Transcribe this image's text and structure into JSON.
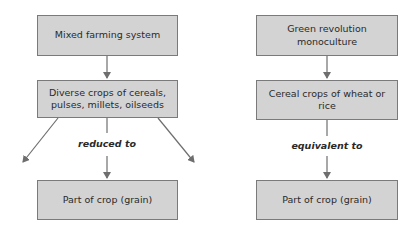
{
  "diagram": {
    "left": {
      "title": "Mixed farming system",
      "middle": "Diverse crops of cereals, pulses, millets, oilseeds",
      "connector_label": "reduced to",
      "bottom": "Part of crop (grain)"
    },
    "right": {
      "title": "Green revolution monoculture",
      "middle": "Cereal crops of wheat or rice",
      "connector_label": "equivalent to",
      "bottom": "Part of crop (grain)"
    },
    "colors": {
      "box_fill": "#d3d3d3",
      "box_border": "#7a7a7a",
      "arrow": "#6e6e6e",
      "text": "#2a2a2a"
    }
  }
}
